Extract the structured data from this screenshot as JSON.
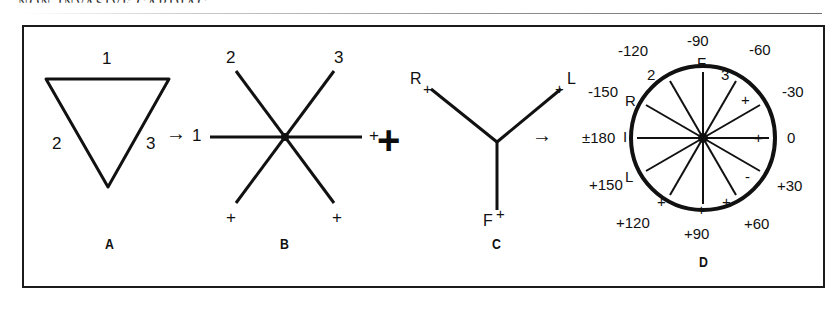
{
  "page": {
    "running_header": "NON-INVASIVE CARDIAC"
  },
  "figure": {
    "panels": [
      {
        "id": "A",
        "letter": "A",
        "name": "einthoven-triangle",
        "description": "Einthoven's equilateral triangle (inverted) formed by the three standard bipolar limb leads",
        "labels": [
          {
            "text": "1",
            "position": "top"
          },
          {
            "text": "2",
            "position": "lower-left"
          },
          {
            "text": "3",
            "position": "lower-right"
          }
        ]
      },
      {
        "id": "B",
        "letter": "B",
        "name": "triaxial-standard-leads",
        "description": "Triaxial system obtained by translating the three sides of the triangle to a common centre",
        "labels": [
          {
            "text": "2",
            "position": "upper-left"
          },
          {
            "text": "3",
            "position": "upper-right"
          },
          {
            "text": "1",
            "position": "left"
          },
          {
            "text": "+",
            "position": "right"
          },
          {
            "text": "+",
            "position": "lower-left"
          },
          {
            "text": "+",
            "position": "lower-right"
          }
        ]
      },
      {
        "id": "C",
        "letter": "C",
        "name": "triaxial-augmented-leads",
        "description": "Triaxial system of the three augmented unipolar limb leads aVR, aVL and aVF",
        "labels": [
          {
            "text": "R",
            "position": "upper-left"
          },
          {
            "text": "+",
            "position": "upper-left-sign"
          },
          {
            "text": "+",
            "position": "upper-right-sign"
          },
          {
            "text": "L",
            "position": "upper-right"
          },
          {
            "text": "F",
            "position": "bottom"
          },
          {
            "text": "+",
            "position": "bottom-sign"
          }
        ]
      },
      {
        "id": "D",
        "letter": "D",
        "name": "hexaxial-reference-system",
        "description": "Complete hexaxial reference system with degree scale",
        "degree_labels": [
          {
            "text": "-90",
            "angle_deg": -90
          },
          {
            "text": "-60",
            "angle_deg": -60
          },
          {
            "text": "-30",
            "angle_deg": -30
          },
          {
            "text": "0",
            "angle_deg": 0
          },
          {
            "text": "+30",
            "angle_deg": 30
          },
          {
            "text": "+60",
            "angle_deg": 60
          },
          {
            "text": "+90",
            "angle_deg": 90
          },
          {
            "text": "+120",
            "angle_deg": 120
          },
          {
            "text": "+150",
            "angle_deg": 150
          },
          {
            "text": "±180",
            "angle_deg": 180
          },
          {
            "text": "-150",
            "angle_deg": -150
          },
          {
            "text": "-120",
            "angle_deg": -120
          }
        ],
        "lead_labels": [
          {
            "text": "F",
            "angle_deg": -90,
            "lead": "aVF"
          },
          {
            "text": "2",
            "angle_deg": -120,
            "lead": "lead II"
          },
          {
            "text": "3",
            "angle_deg": -60,
            "lead": "lead III"
          },
          {
            "text": "R",
            "angle_deg": -150,
            "lead": "aVR"
          },
          {
            "text": "I",
            "angle_deg": 180,
            "lead": "lead I"
          },
          {
            "text": "L",
            "angle_deg": 150,
            "lead": "aVL"
          }
        ],
        "polarity_marks": [
          {
            "text": "+",
            "angle_deg": -30
          },
          {
            "text": "+",
            "angle_deg": 0
          },
          {
            "text": "-",
            "angle_deg": 30
          },
          {
            "text": "+",
            "angle_deg": 60
          },
          {
            "text": "+",
            "angle_deg": 90
          },
          {
            "text": "+",
            "angle_deg": 120
          }
        ]
      }
    ],
    "connectors": [
      {
        "id": "c1",
        "symbol": "→",
        "name": "arrow-a-to-b"
      },
      {
        "id": "c2",
        "symbol": "+",
        "name": "plus-b-and-c"
      },
      {
        "id": "c3",
        "symbol": "→",
        "name": "arrow-c-to-d"
      }
    ]
  },
  "colors": {
    "ink": "#111111",
    "frame": "#1b1b1b",
    "background": "#ffffff"
  }
}
